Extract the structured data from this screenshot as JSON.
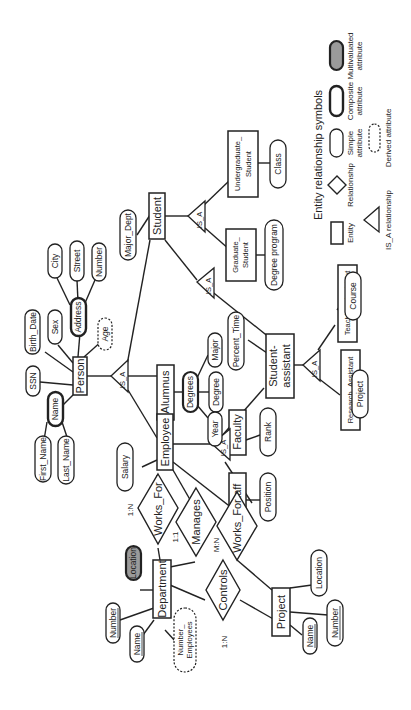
{
  "diagram": {
    "orientation": "rotated -90 degrees (text reads bottom-to-top)",
    "entities": {
      "person": "Person",
      "student": "Student",
      "alumnus": "Alumnus",
      "employee": "Employee",
      "faculty": "Faculty",
      "staff": "Staff",
      "student_assistant_1": "Student-",
      "student_assistant_2": "assistant",
      "graduate_student_1": "Graduate_",
      "graduate_student_2": "Student",
      "undergraduate_student_1": "Undergraduate_",
      "undergraduate_student_2": "Student",
      "teaching_assistant": "Teaching_Assistant",
      "research_assistant": "Research_Assistant",
      "department": "Department",
      "project": "Project"
    },
    "relationships": {
      "works_for_1": "Works_For",
      "manages": "Manages",
      "works_for_2": "Works_For",
      "controls": "Controls"
    },
    "isa_label": "IS_A",
    "attributes": {
      "ssn": "SSN",
      "birth_date": "Birth_Date",
      "sex": "Sex",
      "address": "Address",
      "city": "City",
      "street": "Street",
      "number": "Number",
      "age": "Age",
      "name": "Name",
      "first_name": "First_Name",
      "last_name": "Last_Name",
      "major_dept": "Major_Dept",
      "degrees": "Degrees",
      "degree": "Degree",
      "major": "Major",
      "year": "Year",
      "percent_time": "Percent_Time",
      "degree_program": "Degree program",
      "class": "Class",
      "course": "Course",
      "project_attr": "Project",
      "salary": "Salary",
      "rank": "Rank",
      "position": "Position",
      "dept_location": "Location",
      "dept_number": "Number",
      "dept_name": "Name",
      "dept_num_employees_1": "Number_",
      "dept_num_employees_2": "Employees",
      "proj_location": "Location",
      "proj_number": "Number",
      "proj_name": "Name"
    },
    "cardinalities": {
      "works_for_1": "1:N",
      "manages": "1:1",
      "works_for_2": "M:N",
      "controls": "1:N"
    }
  },
  "legend": {
    "title": "Entity relationship symbols",
    "entity": "Entity",
    "relationship": "Relationship",
    "simple_1": "Simple",
    "simple_2": "attribute",
    "composite_1": "Composite",
    "composite_2": "attribute",
    "multivalued_1": "Multivaluated",
    "multivalued_2": "attribute",
    "isa": "IS_A relationship",
    "derived": "Derived attribute"
  }
}
